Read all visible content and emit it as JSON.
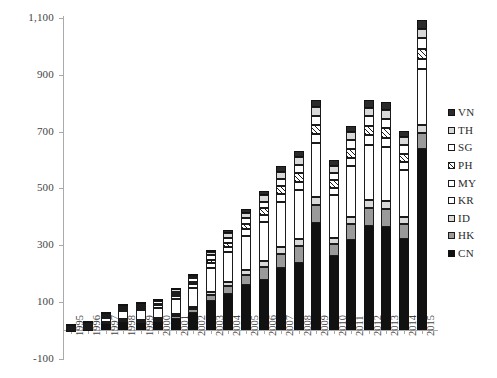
{
  "chart_data": {
    "type": "bar",
    "subtype": "stacked-column",
    "title": "",
    "xlabel": "",
    "ylabel": "",
    "ylim": [
      -100,
      1100
    ],
    "ytick_step": 200,
    "ytick_labels": [
      "-100",
      "100",
      "300",
      "500",
      "700",
      "900",
      "1,100"
    ],
    "ytick_values": [
      -100,
      100,
      300,
      500,
      700,
      900,
      1100
    ],
    "grid": false,
    "legend_position": "right",
    "categories": [
      "1995",
      "1996",
      "1997",
      "1998",
      "1999",
      "2000",
      "2001",
      "2002",
      "2003",
      "2004",
      "2005",
      "2006",
      "2007",
      "2008",
      "2009",
      "2010",
      "2011",
      "2012",
      "2013",
      "2014",
      "2015"
    ],
    "series": [
      {
        "name": "CN",
        "fill": "solid-black",
        "values": [
          2,
          3,
          22,
          28,
          25,
          28,
          40,
          60,
          103,
          128,
          158,
          178,
          218,
          237,
          378,
          262,
          318,
          368,
          362,
          322,
          638
        ]
      },
      {
        "name": "HK",
        "fill": "gray",
        "values": [
          3,
          4,
          5,
          6,
          6,
          8,
          10,
          14,
          20,
          28,
          36,
          44,
          52,
          58,
          62,
          42,
          56,
          62,
          64,
          52,
          58
        ]
      },
      {
        "name": "ID",
        "fill": "light-gray",
        "values": [
          2,
          3,
          3,
          4,
          4,
          5,
          6,
          8,
          11,
          14,
          17,
          20,
          23,
          26,
          28,
          22,
          26,
          28,
          28,
          24,
          26
        ]
      },
      {
        "name": "KR",
        "fill": "white",
        "values": [
          5,
          8,
          14,
          30,
          35,
          38,
          52,
          66,
          86,
          104,
          122,
          140,
          160,
          172,
          190,
          150,
          178,
          196,
          192,
          168,
          198
        ]
      },
      {
        "name": "MY",
        "fill": "white",
        "values": [
          3,
          4,
          5,
          7,
          8,
          9,
          11,
          13,
          16,
          19,
          22,
          25,
          28,
          30,
          32,
          26,
          30,
          32,
          32,
          28,
          34
        ]
      },
      {
        "name": "PH",
        "fill": "hatch",
        "values": [
          2,
          2,
          3,
          4,
          5,
          5,
          7,
          9,
          12,
          15,
          19,
          22,
          26,
          29,
          32,
          26,
          30,
          33,
          33,
          28,
          36
        ]
      },
      {
        "name": "SG",
        "fill": "white",
        "values": [
          3,
          4,
          5,
          6,
          7,
          8,
          10,
          12,
          15,
          18,
          21,
          24,
          27,
          30,
          33,
          27,
          31,
          34,
          34,
          30,
          38
        ]
      },
      {
        "name": "TH",
        "fill": "light-gray",
        "values": [
          2,
          3,
          4,
          5,
          5,
          6,
          8,
          10,
          13,
          16,
          19,
          22,
          25,
          28,
          30,
          24,
          28,
          31,
          31,
          27,
          34
        ]
      },
      {
        "name": "VN",
        "fill": "dark",
        "values": [
          1,
          1,
          2,
          2,
          3,
          3,
          4,
          6,
          8,
          10,
          13,
          16,
          19,
          22,
          25,
          21,
          24,
          27,
          27,
          24,
          30
        ]
      }
    ],
    "totals": [
      23,
      32,
      63,
      92,
      98,
      110,
      148,
      198,
      284,
      352,
      427,
      491,
      598,
      632,
      810,
      600,
      721,
      811,
      803,
      703,
      1092
    ]
  },
  "legend": {
    "items": [
      {
        "label": "VN",
        "swatch": "dark"
      },
      {
        "label": "TH",
        "swatch": "light-gray"
      },
      {
        "label": "SG",
        "swatch": "white"
      },
      {
        "label": "PH",
        "swatch": "hatch"
      },
      {
        "label": "MY",
        "swatch": "white"
      },
      {
        "label": "KR",
        "swatch": "white"
      },
      {
        "label": "ID",
        "swatch": "light-gray"
      },
      {
        "label": "HK",
        "swatch": "gray"
      },
      {
        "label": "CN",
        "swatch": "solid-black"
      }
    ]
  },
  "colors": {
    "axis": "#aaaaaa",
    "text": "#3a3a3a",
    "solid-black": "#111111",
    "gray": "#9a9a9a",
    "light-gray": "#d9d9d9",
    "white": "#ffffff",
    "dark": "#2a2a2a"
  }
}
